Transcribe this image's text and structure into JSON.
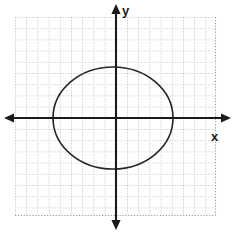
{
  "figure": {
    "background_color": "#ffffff",
    "width": 237,
    "height": 233
  },
  "axes": {
    "x_label": "x",
    "y_label": "y",
    "axis_color": "#1a1a1a",
    "origin_px": {
      "x": 116,
      "y": 118
    },
    "x_axis_extent_px": {
      "start": 6,
      "end": 228
    },
    "y_axis_extent_px": {
      "start": 6,
      "end": 228
    },
    "arrowheads": [
      "left",
      "right",
      "up",
      "down"
    ],
    "tick_labels": [],
    "x_label_pos_px": {
      "x": 215,
      "y": 138
    },
    "y_label_pos_px": {
      "x": 124,
      "y": 14
    }
  },
  "grid": {
    "style": "dotted",
    "color": "#9a9a9a",
    "cell_size_px": 11.2,
    "left_px": 15,
    "top_px": 17,
    "right_px": 215,
    "bottom_px": 215,
    "columns": 18,
    "rows": 18
  },
  "chart_data": {
    "type": "line",
    "title": "",
    "subtitle": "",
    "xlabel": "x",
    "ylabel": "y",
    "grid": true,
    "legend_position": "none",
    "legend": [],
    "annotations": [],
    "xlim": [
      -9.0,
      8.8
    ],
    "ylim": [
      -8.7,
      9.0
    ],
    "tick_labels": {
      "x": [],
      "y": []
    },
    "series": [
      {
        "name": "ellipse",
        "shape": "ellipse",
        "color": "#262626",
        "line_width": 1.6,
        "fill": "none",
        "center": {
          "x": -0.27,
          "y": 0.0
        },
        "semi_axis_x": 5.36,
        "semi_axis_y": 4.55,
        "center_px": {
          "x": 113,
          "y": 118
        },
        "semi_axis_x_px": 60,
        "semi_axis_y_px": 51,
        "extent_px": {
          "left": 53,
          "right": 173,
          "top": 67,
          "bottom": 169
        },
        "vertices": [
          {
            "x": -5.63,
            "y": 0.0
          },
          {
            "x": 5.09,
            "y": 0.0
          },
          {
            "x": -0.27,
            "y": 4.55
          },
          {
            "x": -0.27,
            "y": -4.55
          }
        ]
      }
    ]
  }
}
